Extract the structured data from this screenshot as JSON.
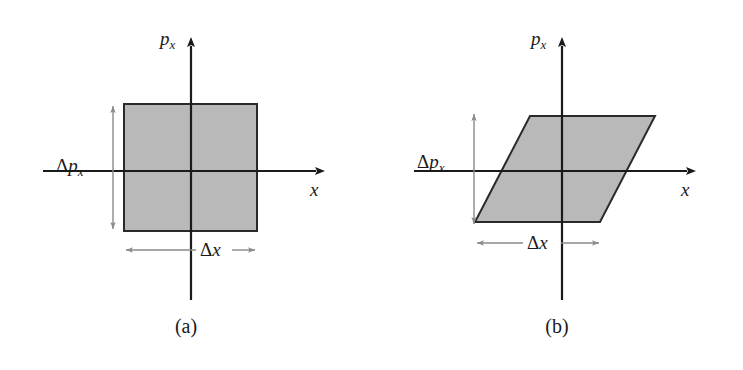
{
  "figure": {
    "background_color": "#ffffff",
    "axis_color": "#1a1a1a",
    "shape_fill_color": "#b9b9b9",
    "shape_stroke_color": "#2a2a2a",
    "dimension_arrow_color": "#808080"
  },
  "panels": [
    {
      "id": "a",
      "caption": "(a)",
      "shape": "rectangle",
      "axes": {
        "x_label": "x",
        "y_label_base": "p",
        "y_label_sub": "x"
      },
      "annotations": {
        "momentum_spread_sym": "Δ",
        "momentum_spread_base": "p",
        "momentum_spread_sub": "x",
        "position_spread_sym": "Δ",
        "position_spread_base": "x"
      }
    },
    {
      "id": "b",
      "caption": "(b)",
      "shape": "parallelogram",
      "axes": {
        "x_label": "x",
        "y_label_base": "p",
        "y_label_sub": "x"
      },
      "annotations": {
        "momentum_spread_sym": "Δ",
        "momentum_spread_base": "p",
        "momentum_spread_sub": "x",
        "position_spread_sym": "Δ",
        "position_spread_base": "x"
      }
    }
  ]
}
